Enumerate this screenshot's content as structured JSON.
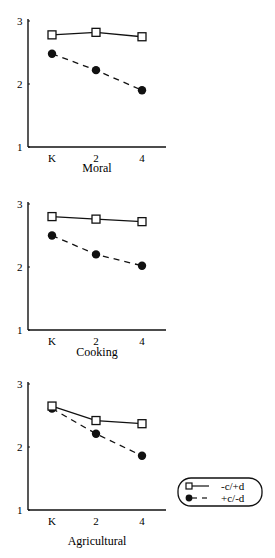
{
  "chart_data": [
    {
      "type": "line",
      "title": "Moral",
      "xlabel": "",
      "ylabel": "",
      "categories": [
        "K",
        "2",
        "4"
      ],
      "yticks": [
        "1",
        "2",
        "3"
      ],
      "ylim": [
        1,
        3
      ],
      "grid": false,
      "series": [
        {
          "name": "-c/+d",
          "marker": "open-square",
          "line": "solid",
          "values": [
            2.78,
            2.82,
            2.75
          ]
        },
        {
          "name": "+c/-d",
          "marker": "filled-circle",
          "line": "dashed",
          "values": [
            2.48,
            2.22,
            1.9
          ]
        }
      ]
    },
    {
      "type": "line",
      "title": "Cooking",
      "xlabel": "",
      "ylabel": "",
      "categories": [
        "K",
        "2",
        "4"
      ],
      "yticks": [
        "1",
        "2",
        "3"
      ],
      "ylim": [
        1,
        3
      ],
      "grid": false,
      "series": [
        {
          "name": "-c/+d",
          "marker": "open-square",
          "line": "solid",
          "values": [
            2.8,
            2.76,
            2.72
          ]
        },
        {
          "name": "+c/-d",
          "marker": "filled-circle",
          "line": "dashed",
          "values": [
            2.5,
            2.2,
            2.02
          ]
        }
      ]
    },
    {
      "type": "line",
      "title": "Agricultural",
      "xlabel": "",
      "ylabel": "",
      "categories": [
        "K",
        "2",
        "4"
      ],
      "yticks": [
        "1",
        "2",
        "3"
      ],
      "ylim": [
        1,
        3
      ],
      "grid": false,
      "series": [
        {
          "name": "-c/+d",
          "marker": "open-square",
          "line": "solid",
          "values": [
            2.65,
            2.42,
            2.37
          ]
        },
        {
          "name": "+c/-d",
          "marker": "filled-circle",
          "line": "dashed",
          "values": [
            2.61,
            2.21,
            1.86
          ]
        }
      ]
    }
  ],
  "legend": {
    "position": "right of bottom chart",
    "entries": [
      {
        "label": "-c/+d",
        "marker": "open-square",
        "line": "solid"
      },
      {
        "label": "+c/-d",
        "marker": "filled-circle",
        "line": "dashed"
      }
    ]
  },
  "colors": {
    "ink": "#111111",
    "background": "#ffffff"
  }
}
